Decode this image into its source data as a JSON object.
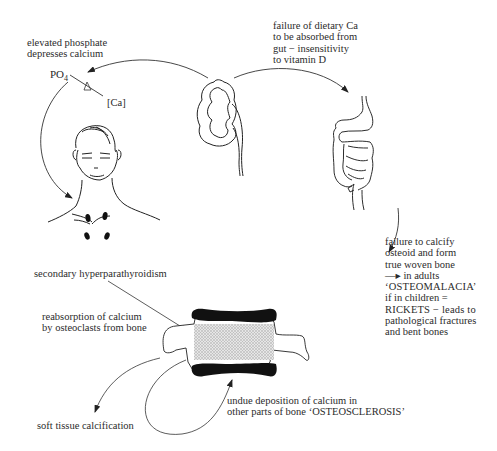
{
  "diagram": {
    "labels": {
      "phosphate": {
        "lines": [
          "elevated phosphate",
          "depresses calcium"
        ]
      },
      "po4_symbol": "PO",
      "po4_subscript": "4",
      "ca_symbol": "[Ca]",
      "gut_failure": {
        "lines": [
          "failure of dietary Ca",
          "to be absorbed from",
          "gut − insensitivity",
          "to vitamin D"
        ]
      },
      "hyperparathyroidism": "secondary hyperparathyroidism",
      "osteomalacia": {
        "lines": [
          "failure to calcify",
          "osteoid and form",
          "true woven bone",
          "—▸ in adults",
          "‘OSTEOMALACIA’",
          "if in children =",
          "RICKETS − leads to",
          "pathological fractures",
          "and bent bones"
        ]
      },
      "reabsorption": {
        "lines": [
          "reabsorption of calcium",
          "by osteoclasts from bone"
        ]
      },
      "osteosclerosis": {
        "lines": [
          "undue deposition of calcium in",
          "other parts of bone ‘OSTEOSCLEROSIS’"
        ]
      },
      "soft_tissue": "soft tissue calcification"
    },
    "illustrations": [
      "kidney",
      "gut",
      "head-and-neck-with-parathyroids",
      "vertebra",
      "seesaw-balance"
    ],
    "colors": {
      "ink": "#2b2b2b",
      "bone_plate": "#111111",
      "stipple": "#c8c8c8"
    }
  }
}
